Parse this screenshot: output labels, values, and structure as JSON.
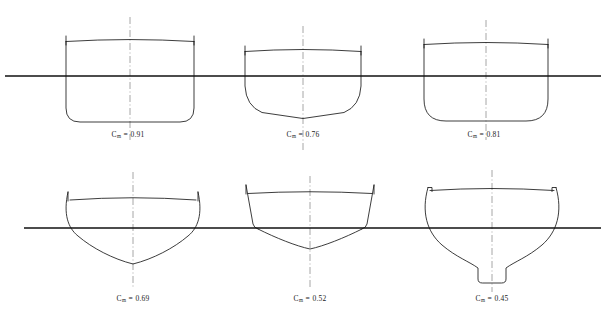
{
  "figure": {
    "symbol": "C",
    "subscript": "m",
    "equals": "=",
    "stroke_color": "#1a1a1a",
    "waterline_color": "#111111",
    "centerline_color": "#8a8a8a",
    "background": "#ffffff"
  },
  "sections": [
    {
      "id": "section-cm-091",
      "name": "full-rectangular-section",
      "label_value": "0.91",
      "label_x": 128,
      "label_y": 134,
      "center_x": 130,
      "waterline_y": 76,
      "deck_y": 39,
      "keel_y": 122,
      "half_beam": 68,
      "bilge_radius": 14,
      "form": "box-like with large bilge radius, vertical sides"
    },
    {
      "id": "section-cm-076",
      "name": "rounded-bilge-section",
      "label_value": "0.76",
      "label_x": 303,
      "label_y": 134,
      "center_x": 303,
      "waterline_y": 76,
      "deck_y": 49,
      "keel_y": 118,
      "half_beam": 58,
      "bilge_radius": 30,
      "form": "rounded bilge with shallow deadrise rising to centerline"
    },
    {
      "id": "section-cm-081",
      "name": "moderate-bilge-section",
      "label_value": "0.81",
      "label_x": 484,
      "label_y": 134,
      "center_x": 486,
      "waterline_y": 76,
      "deck_y": 42,
      "keel_y": 121,
      "half_beam": 62,
      "bilge_radius": 22,
      "form": "near box section with moderate bilge radius"
    },
    {
      "id": "section-cm-069",
      "name": "slack-bilge-vee-section",
      "label_value": "0.69",
      "label_x": 133,
      "label_y": 298,
      "center_x": 133,
      "waterline_y": 228,
      "deck_y": 196,
      "keel_y": 265,
      "half_beam": 65,
      "bilge_radius": 0,
      "form": "flared topsides, slack bilges, deep soft vee bottom"
    },
    {
      "id": "section-cm-052",
      "name": "hard-chine-vee-section",
      "label_value": "0.52",
      "label_x": 310,
      "label_y": 298,
      "center_x": 310,
      "waterline_y": 228,
      "deck_y": 189,
      "keel_y": 250,
      "half_beam": 65,
      "bilge_radius": 0,
      "form": "slab topsides with hard chine at waterline, vee bottom"
    },
    {
      "id": "section-cm-045",
      "name": "fin-keel-section",
      "label_value": "0.45",
      "label_x": 492,
      "label_y": 298,
      "center_x": 492,
      "waterline_y": 228,
      "deck_y": 188,
      "keel_y": 283,
      "half_beam": 65,
      "bilge_radius": 0,
      "form": "wineglass section with narrow deep fin keel"
    }
  ],
  "waterlines": [
    {
      "name": "upper-row-waterline",
      "y": 76,
      "x1": 5,
      "x2": 601
    },
    {
      "name": "lower-row-waterline",
      "y": 228,
      "x1": 24,
      "x2": 601
    }
  ]
}
